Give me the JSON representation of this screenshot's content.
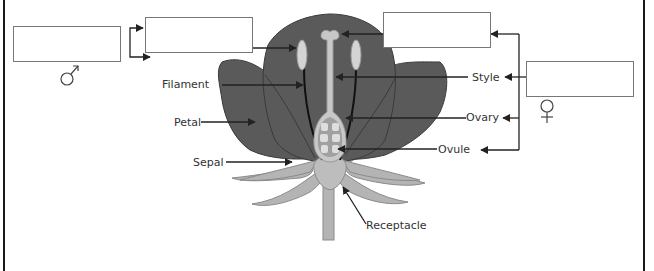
{
  "diagram": {
    "labels": {
      "filament": "Filament",
      "petal": "Petal",
      "sepal": "Sepal",
      "style": "Style",
      "ovary": "Ovary",
      "ovule": "Ovule",
      "receptacle": "Receptacle"
    },
    "answer_boxes": [
      {
        "id": "male-group",
        "value": "",
        "symbol": "male-symbol"
      },
      {
        "id": "anther",
        "value": ""
      },
      {
        "id": "stigma",
        "value": ""
      },
      {
        "id": "female-group",
        "value": "",
        "symbol": "female-symbol"
      }
    ],
    "symbols": {
      "male": "♂",
      "female": "♀"
    },
    "colors": {
      "petal": "#5a5a5a",
      "petal_outline": "#3a3a3a",
      "pistil": "#c8c8c8",
      "pistil_outline": "#9a9a9a",
      "ovule_chamber": "#a0a0a0",
      "ovule": "#dedede",
      "sepal": "#b4b4b4",
      "sepal_outline": "#8a8a8a",
      "line": "#222222",
      "box_border": "#777777",
      "frame": "#1a1a1a"
    }
  }
}
